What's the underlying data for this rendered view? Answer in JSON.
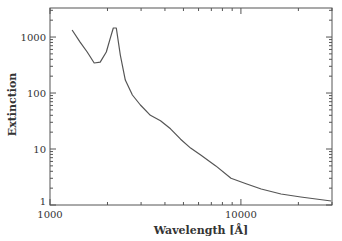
{
  "chart_data": {
    "type": "line",
    "title": "",
    "xlabel": "Wavelength [Å]",
    "ylabel": "Extinction",
    "xscale": "log",
    "yscale": "log",
    "xlim": [
      1000,
      30000
    ],
    "ylim": [
      1,
      3300
    ],
    "x_tick_labels": [
      "1000",
      "10000"
    ],
    "y_tick_labels": [
      "1",
      "10",
      "100",
      "1000"
    ],
    "grid": false,
    "legend": null,
    "series": [
      {
        "name": "Extinction curve",
        "x": [
          1306,
          1438,
          1566,
          1704,
          1833,
          1971,
          2070,
          2146,
          2224,
          2335,
          2481,
          2700,
          2975,
          3357,
          3790,
          4279,
          4830,
          5453,
          6158,
          7390,
          8869,
          10640,
          12770,
          16210,
          20600,
          29700
        ],
        "y": [
          1334,
          813,
          540,
          344,
          357,
          540,
          957,
          1450,
          1450,
          478,
          170,
          92,
          61,
          40,
          32,
          23,
          15,
          10.4,
          7.8,
          5.0,
          3.0,
          2.4,
          1.93,
          1.57,
          1.39,
          1.18
        ]
      }
    ]
  },
  "layout": {
    "plot_left": 50,
    "plot_right": 332,
    "plot_top": 8,
    "plot_bottom": 205,
    "line_color": "#555555"
  }
}
